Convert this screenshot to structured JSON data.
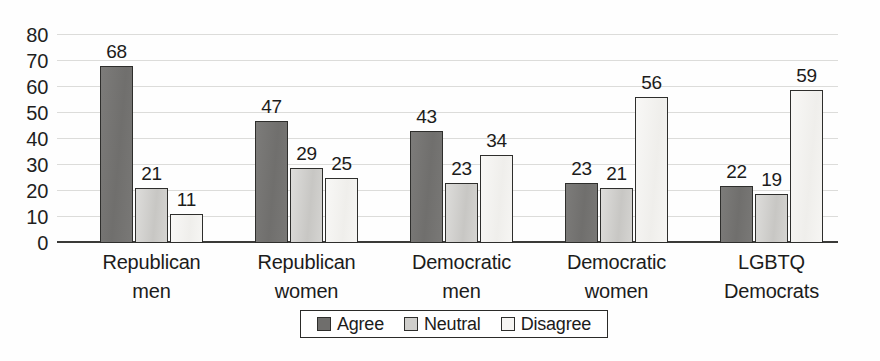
{
  "chart_data": {
    "type": "bar",
    "title": "",
    "subtitle": "",
    "xlabel": "",
    "ylabel": "",
    "ylim": [
      0,
      80
    ],
    "yticks": [
      0,
      10,
      20,
      30,
      40,
      50,
      60,
      70,
      80
    ],
    "ytick_labels": [
      "0",
      "10",
      "20",
      "30",
      "40",
      "50",
      "60",
      "70",
      "80"
    ],
    "grid": true,
    "grid_axis": "y",
    "legend_position": "bottom-center",
    "categories": [
      "Republican men",
      "Republican women",
      "Democratic men",
      "Democratic women",
      "LGBTQ Democrats"
    ],
    "category_lines": [
      [
        "Republican",
        "men"
      ],
      [
        "Republican",
        "women"
      ],
      [
        "Democratic",
        "men"
      ],
      [
        "Democratic",
        "women"
      ],
      [
        "LGBTQ",
        "Democrats"
      ]
    ],
    "series": [
      {
        "name": "Agree",
        "color": "#757472",
        "values": [
          68,
          47,
          43,
          23,
          22
        ]
      },
      {
        "name": "Neutral",
        "color": "#cfcecb",
        "values": [
          21,
          29,
          23,
          21,
          19
        ]
      },
      {
        "name": "Disagree",
        "color": "#f3f2ef",
        "values": [
          11,
          25,
          34,
          56,
          59
        ]
      }
    ],
    "data_labels": [
      [
        "68",
        "21",
        "11"
      ],
      [
        "47",
        "29",
        "25"
      ],
      [
        "43",
        "23",
        "34"
      ],
      [
        "23",
        "21",
        "56"
      ],
      [
        "22",
        "19",
        "59"
      ]
    ],
    "colors": {
      "agree": "#757472",
      "neutral": "#cfcecb",
      "disagree": "#f3f2ef",
      "bar_outline": "#2e2e2c",
      "gridline": "#dcdcda",
      "axis": "#3a3a38",
      "text": "#1c1c1b",
      "background": "#fefefe"
    }
  },
  "legend": {
    "items": [
      {
        "label": "Agree",
        "swatch": "agree"
      },
      {
        "label": "Neutral",
        "swatch": "neutral"
      },
      {
        "label": "Disagree",
        "swatch": "disagree"
      }
    ]
  }
}
